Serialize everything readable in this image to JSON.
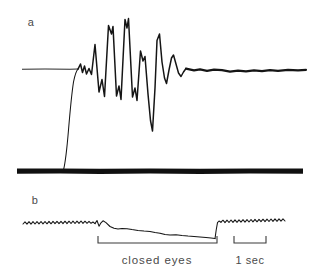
{
  "figure": {
    "background_color": "#ffffff",
    "ink_color": "#151515",
    "text_color": "#4a4a4a",
    "width": 319,
    "height": 274
  },
  "panels": [
    {
      "id": "a",
      "label": "a",
      "label_x": 31,
      "label_y": 26,
      "description": "upper trace: flat baseline, damped oscillatory burst, settling to thick baseline; smooth rising ramp from lower dark band"
    },
    {
      "id": "b",
      "label": "b",
      "label_x": 35,
      "label_y": 204,
      "description": "lower trace: fine sawtooth ripple, slow downward drift during closed eyes, abrupt return and ripple resumes"
    }
  ],
  "annotations": [
    {
      "name": "closed-eyes",
      "text": "closed eyes",
      "text_x": 157,
      "text_y": 264,
      "bracket_x1": 98,
      "bracket_x2": 217,
      "bracket_y": 243,
      "bracket_tick": 7
    },
    {
      "name": "time-scale",
      "text": "1 sec",
      "text_x": 250,
      "text_y": 264,
      "bracket_x1": 234,
      "bracket_x2": 266,
      "bracket_y": 243,
      "bracket_tick": 7
    }
  ],
  "chart_data": {
    "type": "line",
    "title": "",
    "xlabel": "",
    "ylabel": "",
    "grid": false,
    "legend": false,
    "axis_ranges": {
      "x": [
        0,
        319
      ],
      "y_panel_a": [
        10,
        180
      ],
      "y_panel_b": [
        205,
        245
      ]
    },
    "time_scale": {
      "label": "1 sec",
      "pixels_per_second": 32
    },
    "series": [
      {
        "name": "panel-a-baseline-flat",
        "style": "thin",
        "comment": "flat pre-event baseline at y=69 from x=22 to x=78",
        "path": "M 22 69.2 L 45 69.1 L 70 69.2 L 78 69.1"
      },
      {
        "name": "panel-a-oscillation",
        "style": "mid",
        "comment": "damped oscillatory burst; peaks above and below baseline y=69",
        "path": "M 78 69.1 L 80.5 64.0 L 82.5 72.5 L 84.5 66.0 L 86.5 74.0 L 89.0 68.5 L 91.5 74.5 L 95.0 44.5 L 99.0 92.0 L 102.0 79.5 L 104.5 96.5 L 108.5 25.5 L 111.5 34.0 L 113.0 26.5 L 116.5 96.0 L 119.0 86.0 L 121.0 99.5 L 125.0 19.5 L 127.0 28.0 L 128.5 18.5 L 132.5 97.0 L 135.0 88.0 L 137.0 100.5 L 140.5 51.0 L 143.0 61.0 L 145.0 56.5 L 148.0 94.0 L 150.5 120.5 L 152.5 131.0 L 155.0 88.0 L 157.0 40.5 L 159.5 34.0 L 162.0 62.0 L 164.5 78.0 L 166.5 83.5 L 169.0 70.0 L 171.5 58.0 L 173.5 55.0 L 176.0 64.0 L 178.5 73.0 L 181.0 76.5 L 183.5 72.0 L 186.0 68.5"
      },
      {
        "name": "panel-a-settled-baseline",
        "style": "heavy",
        "comment": "thickened, slightly wavy settled baseline to right edge",
        "path": "M 186 68.6 L 194 70.3 L 200 69.4 L 207 70.8 L 214 69.6 L 222 70.2 L 230 71.6 L 238 70.6 L 246 71.4 L 254 70.4 L 262 71.2 L 270 70.2 L 278 70.9 L 288 69.8 L 298 70.4 L 306 69.9"
      },
      {
        "name": "panel-a-rising-ramp",
        "style": "thin",
        "comment": "smooth exponential-like rise from dark band up to baseline",
        "path": "M 63.5 170.0 C 65.5 162.0 67.0 148.0 68.5 130.0 C 70.0 112.0 71.5 95.0 73.5 82.0 C 75.2 73.5 76.8 70.2 78.0 69.1"
      },
      {
        "name": "panel-a-dark-band",
        "style": "band",
        "comment": "heavy solid horizontal bar under panel a at y=171",
        "path": "M 17 171.2 L 60 171.0 L 100 171.3 L 150 171.0 L 200 171.3 L 250 171.0 L 303 171.2"
      },
      {
        "name": "panel-b-ripple-left",
        "style": "thin",
        "comment": "fine sawtooth ripple before eye closure, y around 223",
        "path": "M 23 224.0 L 25 221.8 L 27 224.2 L 29 221.7 L 31 224.1 L 33 221.6 L 35 224.0 L 37 221.6 L 39 223.9 L 41 221.5 L 43 223.9 L 45 221.5 L 47 223.8 L 49 221.4 L 51 223.8 L 53 221.4 L 55 223.7 L 57 221.3 L 59 223.7 L 61 221.3 L 63 223.6 L 65 221.2 L 67 223.6 L 69 221.2 L 71 223.5 L 73 221.1 L 75 223.5 L 77 221.1 L 79 223.4 L 81 221.0 L 83 223.4 L 85 221.2 L 87 223.3 L 89 221.4 L 91 223.3 L 93 222.0 L 95 223.6"
      },
      {
        "name": "panel-b-drift",
        "style": "thin",
        "comment": "slow downward drift during closed eyes with small notches",
        "path": "M 95 223.6 L 97 220.5 L 99 226.2 L 101 222.8 L 103 220.8 L 106 222.6 L 110 226.5 L 114 228.3 L 118 228.9 L 122 228.4 L 127 228.8 L 132 229.6 L 138 230.4 L 144 231.0 L 150 231.4 L 155 232.6 L 160 233.2 L 165 234.6 L 170 235.1 L 176 234.8 L 182 235.6 L 188 236.1 L 194 236.4 L 200 237.0 L 206 237.6 L 211 238.1 L 215 238.6"
      },
      {
        "name": "panel-b-return-step",
        "style": "thin",
        "comment": "abrupt upward return when eyes reopen",
        "path": "M 215 238.6 L 216.2 230.0 L 217.5 222.6 L 219 221.0 L 221 222.2"
      },
      {
        "name": "panel-b-ripple-right",
        "style": "thin",
        "comment": "sawtooth ripple resumes after eye opening, slight upward slope",
        "path": "M 221 222.2 L 223 220.2 L 225 222.6 L 227 220.1 L 229 222.5 L 231 220.0 L 233 222.4 L 235 219.9 L 237 222.3 L 239 219.8 L 241 222.2 L 243 219.7 L 245 222.1 L 247 219.6 L 249 222.0 L 251 219.5 L 253 221.9 L 255 219.4 L 257 221.8 L 259 219.3 L 261 221.7 L 263 219.2 L 265 221.6 L 267 219.1 L 269 221.5 L 271 219.0 L 273 221.4 L 275 218.9 L 277 221.3 L 279 218.8 L 281 221.2 L 283 218.8 L 285 221.0"
      }
    ]
  }
}
